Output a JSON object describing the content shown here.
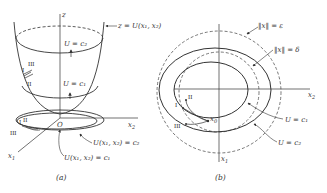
{
  "colors": {
    "ink": "#333333",
    "background": "#ffffff"
  },
  "panel_a": {
    "caption": "(a)",
    "axis_z": "z",
    "axis_x1": "x",
    "axis_x1_sub": "1",
    "axis_x2": "x",
    "axis_x2_sub": "2",
    "origin": "O",
    "surface_label": "z = U(x₁, x₂)",
    "level_c2_on_surface": "U = c₂",
    "level_c1_on_surface": "U = c₁",
    "contour_c2_label": "U(x₁, x₂) = c₂",
    "contour_c1_label": "U(x₁, x₂) = c₁",
    "trajectory_labels": [
      "I",
      "II",
      "III"
    ],
    "floor_trajectory_labels": [
      "I",
      "II",
      "III"
    ]
  },
  "panel_b": {
    "caption": "(b)",
    "axis_x1": "x",
    "axis_x1_sub": "1",
    "axis_x2": "x",
    "axis_x2_sub": "2",
    "epsilon_label": "‖x‖ = ε",
    "delta_label": "‖x‖ = δ",
    "contour_c1_label": "U = c₁",
    "contour_c2_label": "U = c₂",
    "initial_point": "x",
    "initial_point_sub": "0",
    "trajectory_labels": [
      "I",
      "II",
      "III"
    ]
  }
}
